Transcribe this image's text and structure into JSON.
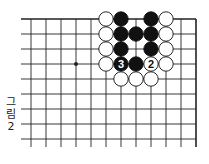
{
  "diagram": {
    "caption_lines": [
      "그",
      "림",
      "2"
    ],
    "grid": {
      "origin_x": 31,
      "origin_y": 19,
      "spacing": 15,
      "cols": 12,
      "rows": 9,
      "top_edge": true,
      "right_edge": true
    },
    "star_points": [
      {
        "col": 3,
        "row": 3
      }
    ],
    "stones": [
      {
        "col": 5,
        "row": 0,
        "color": "white"
      },
      {
        "col": 6,
        "row": 0,
        "color": "black"
      },
      {
        "col": 8,
        "row": 0,
        "color": "black"
      },
      {
        "col": 9,
        "row": 0,
        "color": "white"
      },
      {
        "col": 5,
        "row": 1,
        "color": "white"
      },
      {
        "col": 6,
        "row": 1,
        "color": "black"
      },
      {
        "col": 7,
        "row": 1,
        "color": "black"
      },
      {
        "col": 8,
        "row": 1,
        "color": "black"
      },
      {
        "col": 9,
        "row": 1,
        "color": "white"
      },
      {
        "col": 5,
        "row": 2,
        "color": "white"
      },
      {
        "col": 6,
        "row": 2,
        "color": "black"
      },
      {
        "col": 8,
        "row": 2,
        "color": "black"
      },
      {
        "col": 9,
        "row": 2,
        "color": "white"
      },
      {
        "col": 5,
        "row": 3,
        "color": "white"
      },
      {
        "col": 6,
        "row": 3,
        "color": "black",
        "label": "3"
      },
      {
        "col": 7,
        "row": 3,
        "color": "black"
      },
      {
        "col": 8,
        "row": 3,
        "color": "white",
        "label": "2"
      },
      {
        "col": 9,
        "row": 3,
        "color": "white"
      },
      {
        "col": 6,
        "row": 4,
        "color": "white"
      },
      {
        "col": 7,
        "row": 4,
        "color": "white"
      },
      {
        "col": 8,
        "row": 4,
        "color": "white"
      }
    ],
    "colors": {
      "line": "#222222",
      "black_stone": "#111111",
      "white_stone": "#ffffff"
    }
  }
}
